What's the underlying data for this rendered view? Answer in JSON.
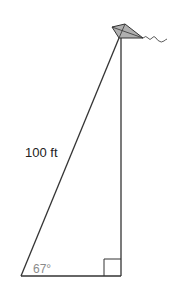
{
  "figure": {
    "hypotenuse_label": "100 ft",
    "angle_label": "67°",
    "right_angle_marker": true,
    "kite_fill": "#b0b0b0",
    "line_color": "#333333"
  }
}
